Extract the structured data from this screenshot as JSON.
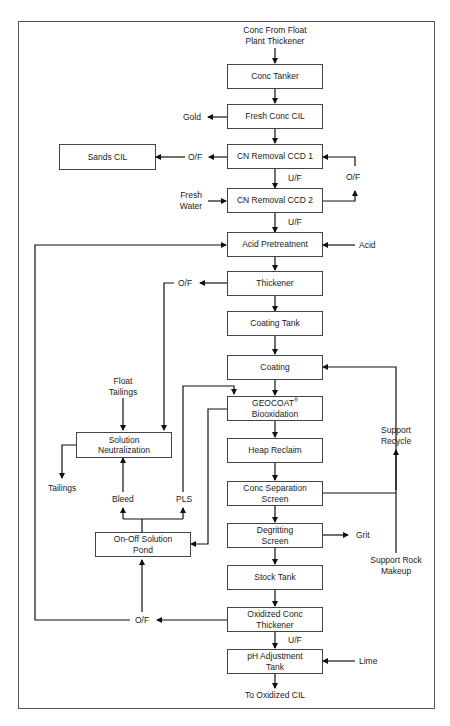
{
  "diagram": {
    "type": "process-flow",
    "boxes": {
      "conc_tanker": "Conc Tanker",
      "fresh_conc_cil": "Fresh Conc CIL",
      "cn_removal_ccd1": "CN Removal CCD 1",
      "cn_removal_ccd2": "CN Removal CCD 2",
      "sands_cil": "Sands CIL",
      "acid_pretreatment": "Acid Pretreatnent",
      "thickener": "Thickener",
      "coating_tank": "Coating Tank",
      "coating": "Coating",
      "geocoat_line1": "GEOCOAT",
      "geocoat_reg": "®",
      "geocoat_line2": "Biooxidation",
      "heap_reclaim": "Heap Reclaim",
      "conc_sep_line1": "Conc Separation",
      "conc_sep_line2": "Screen",
      "degritting_line1": "Degritting",
      "degritting_line2": "Screen",
      "stock_tank": "Stock Tank",
      "oxidized_line1": "Oxidized Conc",
      "oxidized_line2": "Thickener",
      "ph_line1": "pH Adjustment",
      "ph_line2": "Tank",
      "solution_neut_line1": "Solution",
      "solution_neut_line2": "Neutralization",
      "onoff_pond_line1": "On-Off Solution",
      "onoff_pond_line2": "Pond"
    },
    "labels": {
      "conc_from_line1": "Conc From Float",
      "conc_from_line2": "Plant Thickener",
      "gold": "Gold",
      "of_sands": "O/F",
      "uf_1": "U/F",
      "of_loop": "O/F",
      "fresh_water_line1": "Fresh",
      "fresh_water_line2": "Water",
      "uf_2": "U/F",
      "acid": "Acid",
      "of_thickener": "O/F",
      "float_tailings_line1": "Float",
      "float_tailings_line2": "Tailings",
      "tailings": "Tailings",
      "bleed": "Bleed",
      "pls": "PLS",
      "support_recycle_line1": "Support",
      "support_recycle_line2": "Recycle",
      "grit": "Grit",
      "support_rock_line1": "Support Rock",
      "support_rock_line2": "Makeup",
      "of_oxidized": "O/F",
      "uf_3": "U/F",
      "lime": "Lime",
      "to_oxidized_cil": "To Oxidized CIL"
    },
    "colors": {
      "line": "#111111",
      "box_border": "#444444",
      "frame": "#555555"
    }
  }
}
